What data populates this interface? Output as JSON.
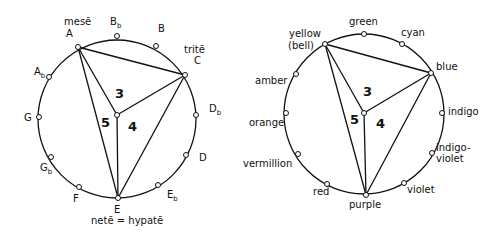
{
  "diagrams": [
    {
      "name": "pitch-circle",
      "points": [
        {
          "id": "A",
          "label": "A",
          "sub": "",
          "extra": "mesē"
        },
        {
          "id": "Bb",
          "label": "B",
          "sub": "b",
          "extra": ""
        },
        {
          "id": "B",
          "label": "B",
          "sub": "",
          "extra": ""
        },
        {
          "id": "C",
          "label": "C",
          "sub": "",
          "extra": "tritē"
        },
        {
          "id": "Db",
          "label": "D",
          "sub": "b",
          "extra": ""
        },
        {
          "id": "D",
          "label": "D",
          "sub": "",
          "extra": ""
        },
        {
          "id": "Eb",
          "label": "E",
          "sub": "b",
          "extra": ""
        },
        {
          "id": "E",
          "label": "E",
          "sub": "",
          "extra": "netē = hypatē"
        },
        {
          "id": "F",
          "label": "F",
          "sub": "",
          "extra": ""
        },
        {
          "id": "Gb",
          "label": "G",
          "sub": "b",
          "extra": ""
        },
        {
          "id": "G",
          "label": "G",
          "sub": "",
          "extra": ""
        },
        {
          "id": "Ab",
          "label": "A",
          "sub": "b",
          "extra": ""
        }
      ],
      "region_labels": [
        "3",
        "4",
        "5"
      ]
    },
    {
      "name": "color-circle",
      "points": [
        {
          "id": "yellow",
          "label": "yellow",
          "extra": "(bell)"
        },
        {
          "id": "green",
          "label": "green",
          "extra": ""
        },
        {
          "id": "cyan",
          "label": "cyan",
          "extra": ""
        },
        {
          "id": "blue",
          "label": "blue",
          "extra": ""
        },
        {
          "id": "indigo",
          "label": "indigo",
          "extra": ""
        },
        {
          "id": "indigo-violet",
          "label": "indigo-",
          "extra": "violet"
        },
        {
          "id": "violet",
          "label": "violet",
          "extra": ""
        },
        {
          "id": "purple",
          "label": "purple",
          "extra": ""
        },
        {
          "id": "red",
          "label": "red",
          "extra": ""
        },
        {
          "id": "vermillion",
          "label": "vermillion",
          "extra": ""
        },
        {
          "id": "orange",
          "label": "orange",
          "extra": ""
        },
        {
          "id": "amber",
          "label": "amber",
          "extra": ""
        }
      ],
      "region_labels": [
        "3",
        "4",
        "5"
      ]
    }
  ]
}
